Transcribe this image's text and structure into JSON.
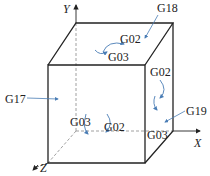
{
  "diagram": {
    "type": "coordinate-plane-selection-cube",
    "axes": {
      "x": "X",
      "y": "Y",
      "z": "Z"
    },
    "plane_codes": {
      "xy_plane": "G17",
      "zx_plane": "G18",
      "yz_plane": "G19"
    },
    "arc_labels": {
      "top_face_cw": "G02",
      "top_face_ccw": "G03",
      "front_face_ccw": "G03",
      "front_face_cw": "G02",
      "right_face_cw": "G02",
      "right_face_ccw": "G03"
    },
    "colors": {
      "edges": "#222222",
      "hidden_edges": "#888888",
      "arrows": "#4a7db5",
      "text": "#222222"
    }
  }
}
